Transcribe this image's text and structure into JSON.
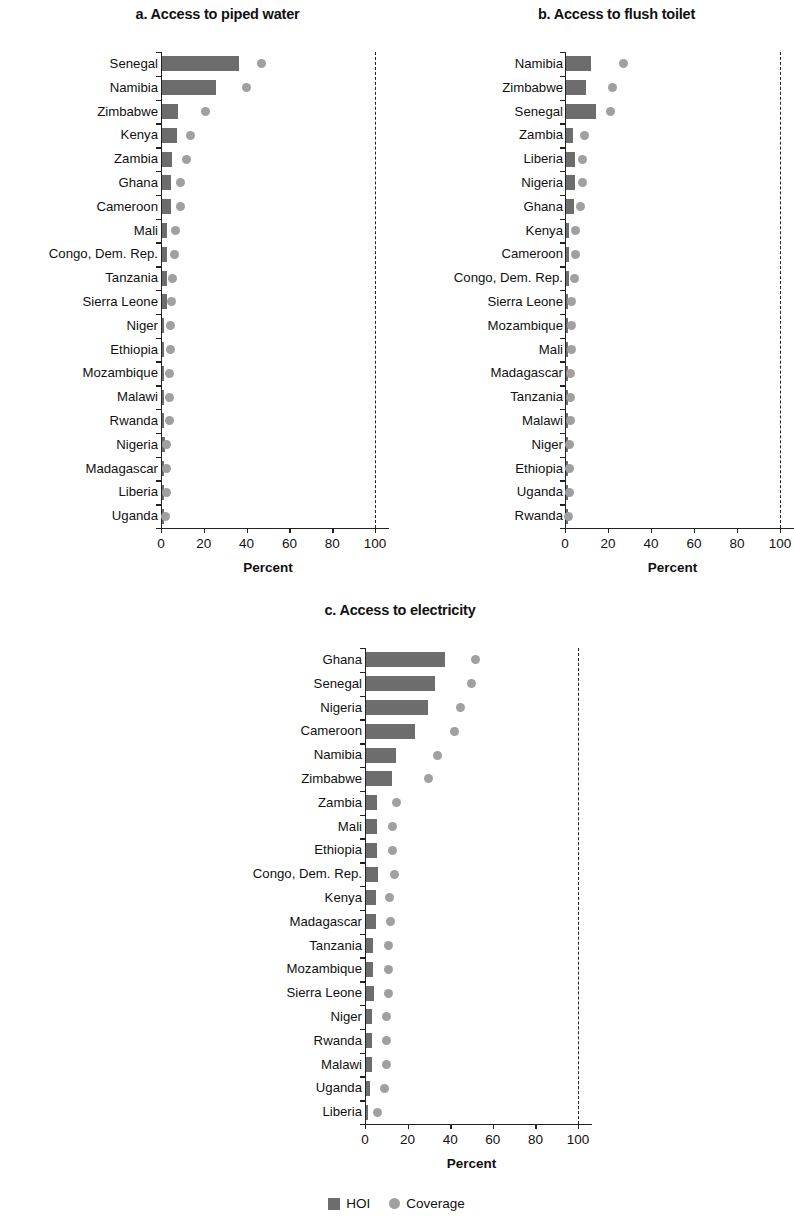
{
  "figure": {
    "legend": {
      "hoi_label": "HOI",
      "coverage_label": "Coverage",
      "hoi_color": "#6d6d6d",
      "coverage_color": "#a0a0a0"
    }
  },
  "chart_data": [
    {
      "type": "bar",
      "title": "a. Access to piped water",
      "xlabel": "Percent",
      "ylabel": "",
      "xlim": [
        0,
        100
      ],
      "xticks": [
        0,
        20,
        40,
        60,
        80,
        100
      ],
      "xticklabels": [
        "0",
        "20",
        "40",
        "60",
        "80",
        "100"
      ],
      "grid": false,
      "reference_line": 100,
      "legend_position": "bottom",
      "categories": [
        "Senegal",
        "Namibia",
        "Zimbabwe",
        "Kenya",
        "Zambia",
        "Ghana",
        "Cameroon",
        "Mali",
        "Congo, Dem. Rep.",
        "Tanzania",
        "Sierra Leone",
        "Niger",
        "Ethiopia",
        "Mozambique",
        "Malawi",
        "Rwanda",
        "Nigeria",
        "Madagascar",
        "Liberia",
        "Uganda"
      ],
      "series": [
        {
          "name": "HOI",
          "type": "bar",
          "values": [
            36,
            25,
            7.5,
            7,
            4.5,
            4,
            4,
            2,
            2,
            2,
            2,
            0.5,
            0.5,
            0.8,
            0.8,
            0.5,
            1.2,
            0.4,
            0.4,
            0.3
          ]
        },
        {
          "name": "Coverage",
          "type": "scatter",
          "values": [
            47,
            40,
            21,
            14,
            12,
            9,
            9,
            7,
            6.5,
            5.5,
            5,
            4.5,
            4.5,
            4,
            4,
            4,
            2.5,
            2.5,
            2.5,
            2
          ]
        }
      ]
    },
    {
      "type": "bar",
      "title": "b. Access to flush toilet",
      "xlabel": "Percent",
      "ylabel": "",
      "xlim": [
        0,
        100
      ],
      "xticks": [
        0,
        20,
        40,
        60,
        80,
        100
      ],
      "xticklabels": [
        "0",
        "20",
        "40",
        "60",
        "80",
        "100"
      ],
      "grid": false,
      "reference_line": 100,
      "legend_position": "bottom",
      "categories": [
        "Namibia",
        "Zimbabwe",
        "Senegal",
        "Zambia",
        "Liberia",
        "Nigeria",
        "Ghana",
        "Kenya",
        "Cameroon",
        "Congo, Dem. Rep.",
        "Sierra Leone",
        "Mozambique",
        "Mali",
        "Madagascar",
        "Tanzania",
        "Malawi",
        "Niger",
        "Ethiopia",
        "Uganda",
        "Rwanda"
      ],
      "series": [
        {
          "name": "HOI",
          "type": "bar",
          "values": [
            11.5,
            9,
            14,
            3,
            4,
            4,
            3.5,
            1,
            1.2,
            1.2,
            0.6,
            0.6,
            0.6,
            0.5,
            0.5,
            0.5,
            0.4,
            0.4,
            0.4,
            0.3
          ]
        },
        {
          "name": "Coverage",
          "type": "scatter",
          "values": [
            27,
            22,
            21,
            9,
            8,
            8,
            7,
            5,
            5,
            4.5,
            3,
            3,
            3,
            2.5,
            2.5,
            2.5,
            2,
            2,
            2,
            1.5
          ]
        }
      ]
    },
    {
      "type": "bar",
      "title": "c. Access to electricity",
      "xlabel": "Percent",
      "ylabel": "",
      "xlim": [
        0,
        100
      ],
      "xticks": [
        0,
        20,
        40,
        60,
        80,
        100
      ],
      "xticklabels": [
        "0",
        "20",
        "40",
        "60",
        "80",
        "100"
      ],
      "grid": false,
      "reference_line": 100,
      "legend_position": "bottom",
      "categories": [
        "Ghana",
        "Senegal",
        "Nigeria",
        "Cameroon",
        "Namibia",
        "Zimbabwe",
        "Zambia",
        "Mali",
        "Ethiopia",
        "Congo, Dem. Rep.",
        "Kenya",
        "Madagascar",
        "Tanzania",
        "Mozambique",
        "Sierra Leone",
        "Niger",
        "Rwanda",
        "Malawi",
        "Uganda",
        "Liberia"
      ],
      "series": [
        {
          "name": "HOI",
          "type": "bar",
          "values": [
            37,
            32,
            29,
            23,
            14,
            12,
            5,
            5,
            5,
            5.5,
            4.5,
            4.5,
            3,
            3,
            3.5,
            2.5,
            2.5,
            2.5,
            1.5,
            0.8
          ]
        },
        {
          "name": "Coverage",
          "type": "scatter",
          "values": [
            52,
            50,
            45,
            42,
            34,
            30,
            15,
            13,
            13,
            14,
            11.5,
            12,
            11,
            11,
            11,
            10,
            10,
            10,
            9,
            6
          ]
        }
      ]
    }
  ]
}
